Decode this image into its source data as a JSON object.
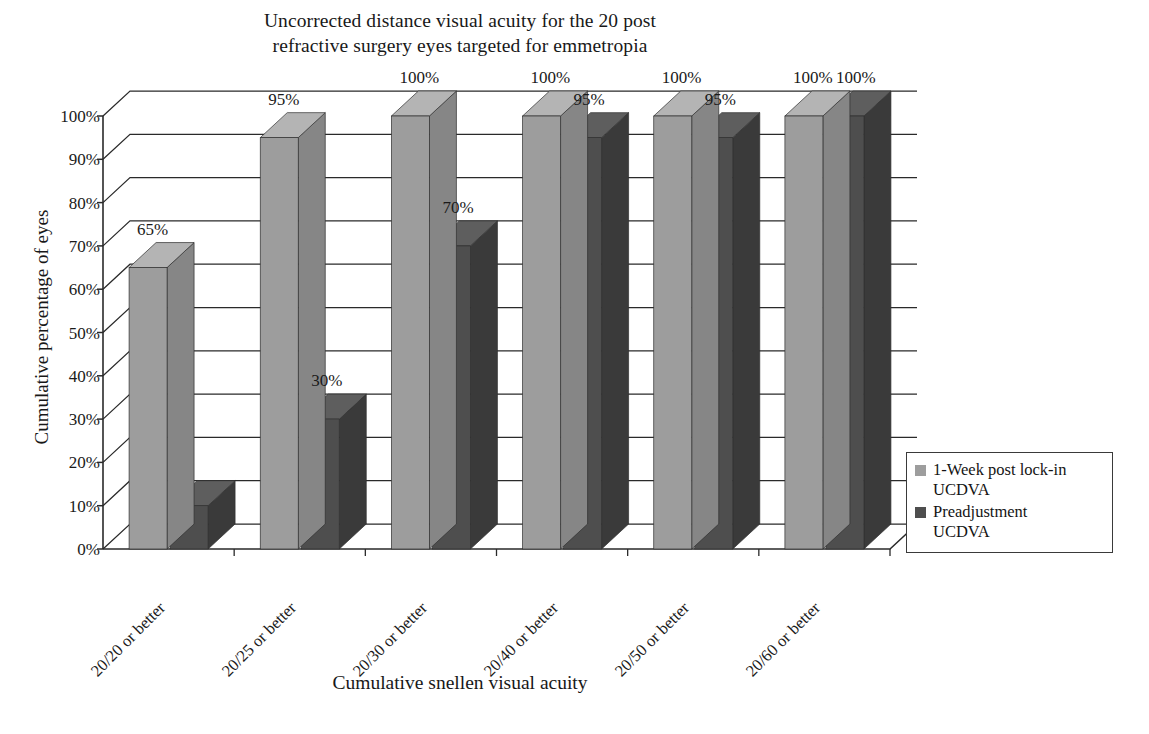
{
  "chart_data": {
    "type": "bar",
    "title": "Uncorrected distance visual acuity for the 20 post refractive surgery eyes targeted for emmetropia",
    "title_line1": "Uncorrected distance visual acuity for the 20 post",
    "title_line2": "refractive surgery eyes targeted for emmetropia",
    "xlabel": "Cumulative snellen visual acuity",
    "ylabel": "Cumulative percentage of eyes",
    "categories": [
      "20/20 or better",
      "20/25 or better",
      "20/30 or better",
      "20/40 or better",
      "20/50 or better",
      "20/60 or better"
    ],
    "series": [
      {
        "name": "1-Week post lock-in UCDVA",
        "color": "#9d9d9d",
        "values": [
          65,
          95,
          100,
          100,
          100,
          100
        ],
        "labels": [
          "65%",
          "95%",
          "100%",
          "100%",
          "100%",
          "100%"
        ]
      },
      {
        "name": "Preadjustment UCDVA",
        "color": "#4e4e4e",
        "values": [
          10,
          30,
          70,
          95,
          95,
          100
        ],
        "labels": [
          "",
          "30%",
          "70%",
          "95%",
          "95%",
          "100%"
        ]
      }
    ],
    "ylim": [
      0,
      100
    ],
    "ytick_labels": [
      "100%",
      "90%",
      "80%",
      "70%",
      "60%",
      "50%",
      "40%",
      "30%",
      "20%",
      "10%",
      "0%"
    ],
    "ytick_values": [
      100,
      90,
      80,
      70,
      60,
      50,
      40,
      30,
      20,
      10,
      0
    ],
    "grid": true,
    "legend_position": "right",
    "style": "3d-column"
  },
  "legend": {
    "items": [
      {
        "label_line1": "1-Week post lock-in",
        "label_line2": "UCDVA",
        "color": "#9d9d9d"
      },
      {
        "label_line1": "Preadjustment",
        "label_line2": "UCDVA",
        "color": "#4e4e4e"
      }
    ]
  },
  "colors": {
    "series_light_front": "#9d9d9d",
    "series_light_top": "#b4b4b4",
    "series_light_side": "#868686",
    "series_dark_front": "#4e4e4e",
    "series_dark_top": "#5e5e5e",
    "series_dark_side": "#3a3a3a",
    "axis": "#2a2a2a",
    "grid": "#2a2a2a",
    "background": "#ffffff",
    "text": "#1a1a1a"
  }
}
